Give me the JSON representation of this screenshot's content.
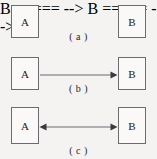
{
  "figure": {
    "background_color": "#f4f3f1",
    "line_color": "#6d6a72",
    "node_fill": "#faf9f8",
    "text_color": "#1b1b1b",
    "rows": [
      {
        "id": "a",
        "caption": "( a )",
        "left_node": "A",
        "right_node": "B",
        "connector": "single-arrow-right"
      },
      {
        "id": "b",
        "caption": "( b )",
        "left_node": "A",
        "right_node": "B",
        "connector": "double-headed-arrow"
      },
      {
        "id": "c",
        "caption": "( c )",
        "left_node": "A",
        "right_node": "B",
        "connector": "two-parallel-arrows"
      }
    ]
  }
}
